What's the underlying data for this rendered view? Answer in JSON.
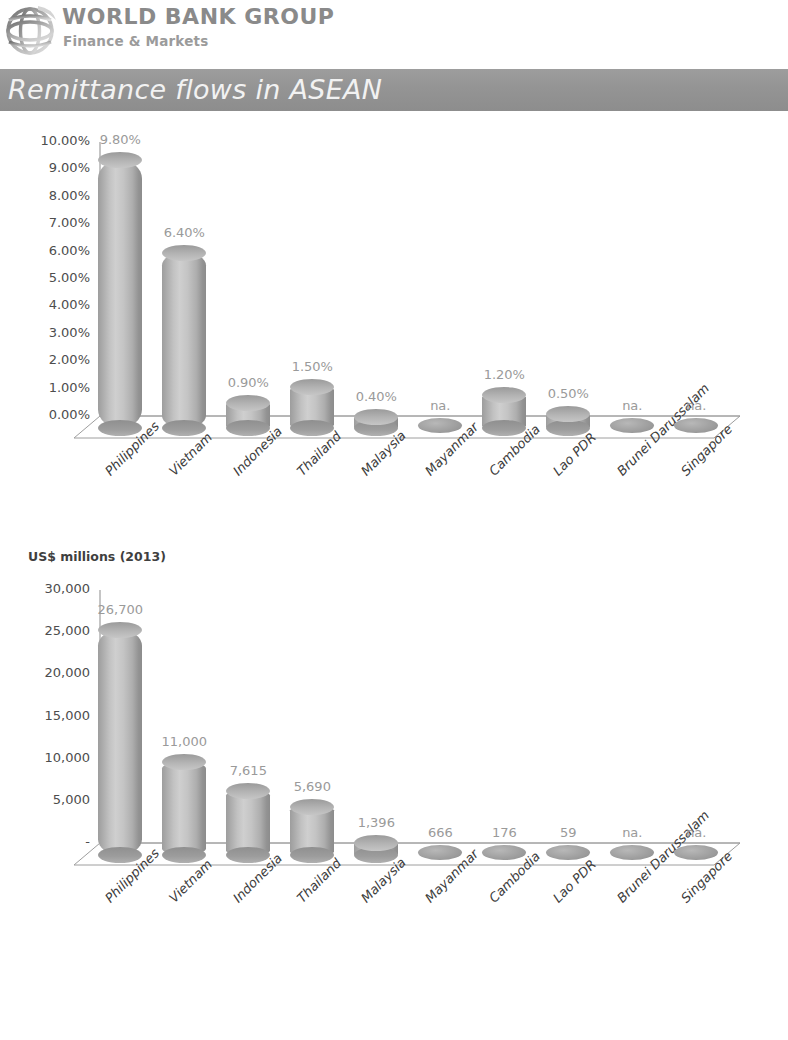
{
  "brand": {
    "logo_icon": "world-bank-globe-icon",
    "title": "WORLD BANK GROUP",
    "subtitle": "Finance & Markets"
  },
  "title_band": {
    "text": "Remittance flows in ASEAN",
    "background_color": "#949494",
    "text_color": "#f2f2f2"
  },
  "chart_data": [
    {
      "type": "bar",
      "title": "",
      "subtitle": "",
      "xlabel": "",
      "ylabel": "",
      "ylim": [
        0,
        10
      ],
      "grid": false,
      "legend": "none",
      "value_format": "percent",
      "yticks": [
        "0.00%",
        "1.00%",
        "2.00%",
        "3.00%",
        "4.00%",
        "5.00%",
        "6.00%",
        "7.00%",
        "8.00%",
        "9.00%",
        "10.00%"
      ],
      "categories": [
        "Philippines",
        "Vietnam",
        "Indonesia",
        "Thailand",
        "Malaysia",
        "Mayanmar",
        "Cambodia",
        "Lao PDR",
        "Brunei Darussalam",
        "Singapore"
      ],
      "values": [
        9.8,
        6.4,
        0.9,
        1.5,
        0.4,
        null,
        1.2,
        0.5,
        null,
        null
      ],
      "data_labels": [
        "9.80%",
        "6.40%",
        "0.90%",
        "1.50%",
        "0.40%",
        "na.",
        "1.20%",
        "0.50%",
        "na.",
        "na."
      ]
    },
    {
      "type": "bar",
      "title": "",
      "subtitle": "US$ millions (2013)",
      "xlabel": "",
      "ylabel": "",
      "ylim": [
        0,
        30000
      ],
      "grid": false,
      "legend": "none",
      "value_format": "thousands",
      "yticks": [
        "-",
        "5,000",
        "10,000",
        "15,000",
        "20,000",
        "25,000",
        "30,000"
      ],
      "categories": [
        "Philippines",
        "Vietnam",
        "Indonesia",
        "Thailand",
        "Malaysia",
        "Mayanmar",
        "Cambodia",
        "Lao PDR",
        "Brunei Darussalam",
        "Singapore"
      ],
      "values": [
        26700,
        11000,
        7615,
        5690,
        1396,
        666,
        176,
        59,
        null,
        null
      ],
      "data_labels": [
        "26,700",
        "11,000",
        "7,615",
        "5,690",
        "1,396",
        "666",
        "176",
        "59",
        "na.",
        "na."
      ]
    }
  ]
}
